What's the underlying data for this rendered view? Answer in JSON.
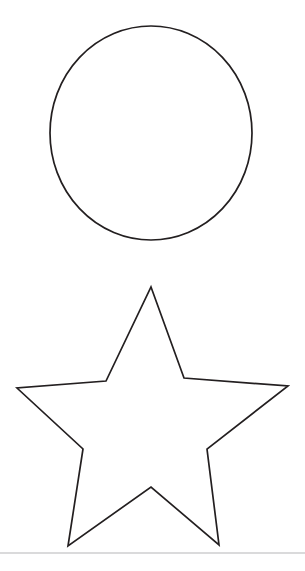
{
  "page": {
    "title": "Shapes Outline Page",
    "background_color": "#ffffff",
    "width": 305,
    "height": 571
  },
  "style": {
    "outline_color": "#231f20",
    "fill_color": "#ffffff",
    "outline_width": 1.7,
    "divider_color": "#b6b6b8",
    "divider_width": 1.2
  },
  "shapes": [
    {
      "name": "circle",
      "label": "Circle",
      "type": "ellipse",
      "center_x": 151,
      "center_y": 133,
      "radius_x": 101,
      "radius_y": 107,
      "top": 26,
      "bottom": 240,
      "left": 50,
      "right": 252
    },
    {
      "name": "star",
      "label": "Five-pointed star",
      "type": "polygon",
      "points_count": 5,
      "center_x": 151,
      "center_y": 418,
      "top": 287,
      "bottom": 546,
      "left": 17,
      "right": 288,
      "polygon_points": "151,287 184,378 288,386 207,449 219,545 151,487 68,546 83,449 17,388 106,381"
    }
  ],
  "divider": {
    "name": "bottom-rule",
    "label": "Horizontal rule",
    "y": 553,
    "x_start": 0,
    "x_end": 305
  }
}
